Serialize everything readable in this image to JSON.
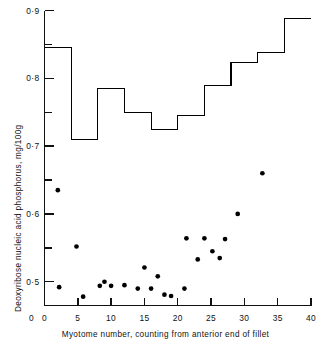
{
  "chart_data": {
    "type": "scatter",
    "title": "",
    "xlabel": "Myotome number, counting from anterior end of fillet",
    "ylabel": "Deoxyribose nucleic acid phosphorus, mg/100g",
    "xlim": [
      0,
      40
    ],
    "ylim": [
      0.465,
      0.9
    ],
    "grid": false,
    "legend_position": "none",
    "xticks": [
      0,
      5,
      10,
      15,
      20,
      25,
      30,
      35,
      40
    ],
    "xtick_labels": [
      "0",
      "5",
      "10",
      "15",
      "20",
      "25",
      "30",
      "35",
      "40"
    ],
    "yticks": [
      0.5,
      0.55,
      0.6,
      0.65,
      0.7,
      0.75,
      0.8,
      0.85,
      0.9
    ],
    "ytick_labels": [
      "0·5",
      "",
      "0·6",
      "",
      "0·7",
      "",
      "0·8",
      "",
      "0·9"
    ],
    "yaxis_origin_label": "0",
    "series": [
      {
        "name": "Individual myotome values",
        "type": "scatter",
        "marker": "filled-circle",
        "color": "#000000",
        "points": [
          {
            "x": 2.0,
            "y": 0.635
          },
          {
            "x": 2.2,
            "y": 0.492
          },
          {
            "x": 4.8,
            "y": 0.552
          },
          {
            "x": 5.8,
            "y": 0.478
          },
          {
            "x": 8.3,
            "y": 0.494
          },
          {
            "x": 9.0,
            "y": 0.5
          },
          {
            "x": 10.0,
            "y": 0.494
          },
          {
            "x": 12.0,
            "y": 0.495
          },
          {
            "x": 14.0,
            "y": 0.49
          },
          {
            "x": 15.0,
            "y": 0.521
          },
          {
            "x": 16.0,
            "y": 0.49
          },
          {
            "x": 17.0,
            "y": 0.508
          },
          {
            "x": 18.0,
            "y": 0.481
          },
          {
            "x": 19.0,
            "y": 0.479
          },
          {
            "x": 21.0,
            "y": 0.49
          },
          {
            "x": 21.3,
            "y": 0.564
          },
          {
            "x": 23.0,
            "y": 0.533
          },
          {
            "x": 24.0,
            "y": 0.564
          },
          {
            "x": 25.2,
            "y": 0.545
          },
          {
            "x": 26.3,
            "y": 0.535
          },
          {
            "x": 27.1,
            "y": 0.563
          },
          {
            "x": 29.0,
            "y": 0.6
          },
          {
            "x": 32.7,
            "y": 0.66
          }
        ]
      },
      {
        "name": "Mean values (step histogram)",
        "type": "step",
        "color": "#000000",
        "steps": [
          {
            "x_start": 0,
            "x_end": 4,
            "y": 0.845
          },
          {
            "x_start": 4,
            "x_end": 8,
            "y": 0.71
          },
          {
            "x_start": 8,
            "x_end": 12,
            "y": 0.785
          },
          {
            "x_start": 12,
            "x_end": 16,
            "y": 0.75
          },
          {
            "x_start": 16,
            "x_end": 20,
            "y": 0.725
          },
          {
            "x_start": 20,
            "x_end": 24,
            "y": 0.745
          },
          {
            "x_start": 24,
            "x_end": 28,
            "y": 0.79
          },
          {
            "x_start": 28,
            "x_end": 32,
            "y": 0.823
          },
          {
            "x_start": 32,
            "x_end": 36,
            "y": 0.838
          },
          {
            "x_start": 36,
            "x_end": 40,
            "y": 0.888
          }
        ]
      }
    ]
  }
}
